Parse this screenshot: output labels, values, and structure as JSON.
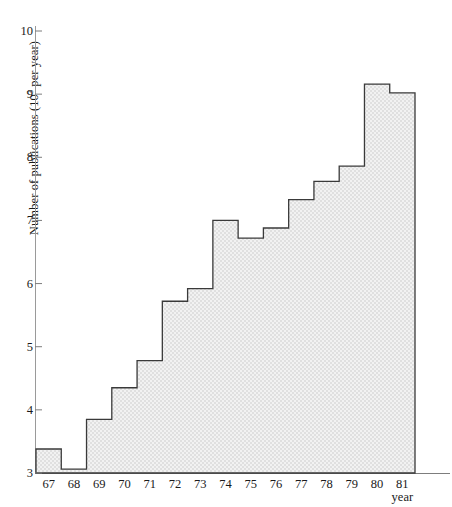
{
  "chart_data": {
    "type": "bar",
    "title": "",
    "xlabel": "year",
    "ylabel": "Number of publications (10³ per year)",
    "ylabel_prefix": "Number of publications (10",
    "ylabel_sup": "3",
    "ylabel_suffix": " per year)",
    "categories": [
      "67",
      "68",
      "69",
      "70",
      "71",
      "72",
      "73",
      "74",
      "75",
      "76",
      "77",
      "78",
      "79",
      "80",
      "81"
    ],
    "values": [
      3.38,
      3.06,
      3.85,
      4.35,
      4.78,
      5.72,
      5.92,
      7.0,
      6.72,
      6.88,
      7.33,
      7.62,
      7.86,
      9.16,
      9.02
    ],
    "ylim": [
      3,
      10
    ],
    "yticks": [
      3,
      4,
      5,
      6,
      7,
      8,
      9,
      10
    ],
    "ytick_labels": [
      "3",
      "4",
      "5",
      "6",
      "7",
      "8",
      "9",
      "10"
    ],
    "xlim": [
      66.5,
      81.5
    ],
    "grid": false,
    "legend": null,
    "style": {
      "fill_color": "#e9e9e9",
      "line_color": "#3a3a3a",
      "axis_color": "#858585",
      "text_color": "#1a1a1a"
    }
  }
}
